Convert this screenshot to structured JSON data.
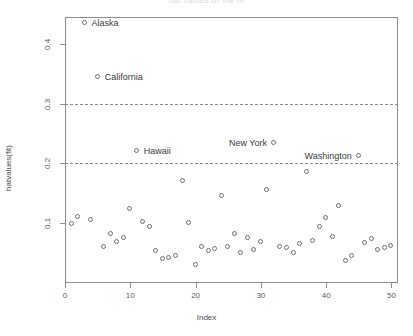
{
  "chart_data": {
    "type": "scatter",
    "title": "hat values of the fit",
    "xlabel": "Index",
    "ylabel": "hatvalues(fit)",
    "xlim": [
      0,
      51
    ],
    "ylim": [
      0.0,
      0.445
    ],
    "xticks": [
      0,
      10,
      20,
      30,
      40,
      50
    ],
    "yticks": [
      0.1,
      0.2,
      0.3,
      0.4
    ],
    "ytick_labels": [
      "0.1",
      "0.2",
      "0.3",
      "0.4"
    ],
    "xtick_labels": [
      "0",
      "10",
      "20",
      "30",
      "40",
      "50"
    ],
    "grid": false,
    "legend": "none",
    "marker": "open-circle",
    "reference_lines": [
      {
        "y": 0.3,
        "style": "dashed",
        "label": "3x mean leverage"
      },
      {
        "y": 0.2,
        "style": "dashed",
        "label": "2x mean leverage"
      }
    ],
    "x": [
      1,
      2,
      3,
      4,
      5,
      6,
      7,
      8,
      9,
      10,
      11,
      12,
      13,
      14,
      15,
      16,
      17,
      18,
      19,
      20,
      21,
      22,
      23,
      24,
      25,
      26,
      27,
      28,
      29,
      30,
      31,
      32,
      33,
      34,
      35,
      36,
      37,
      38,
      39,
      40,
      41,
      42,
      43,
      44,
      45,
      46,
      47,
      48,
      49,
      50
    ],
    "values": [
      0.098,
      0.11,
      0.435,
      0.106,
      0.345,
      0.06,
      0.082,
      0.068,
      0.075,
      0.123,
      0.22,
      0.102,
      0.093,
      0.053,
      0.04,
      0.042,
      0.045,
      0.17,
      0.1,
      0.03,
      0.06,
      0.053,
      0.057,
      0.145,
      0.061,
      0.082,
      0.05,
      0.075,
      0.056,
      0.069,
      0.155,
      0.235,
      0.06,
      0.059,
      0.05,
      0.065,
      0.185,
      0.071,
      0.094,
      0.108,
      0.077,
      0.129,
      0.036,
      0.046,
      0.212,
      0.067,
      0.074,
      0.055,
      0.058,
      0.062
    ],
    "labeled_points": [
      {
        "label": "Alaska",
        "x": 3,
        "y": 0.435,
        "label_side": "right"
      },
      {
        "label": "California",
        "x": 5,
        "y": 0.345,
        "label_side": "right"
      },
      {
        "label": "Hawaii",
        "x": 11,
        "y": 0.22,
        "label_side": "right"
      },
      {
        "label": "New York",
        "x": 32,
        "y": 0.235,
        "label_side": "left"
      },
      {
        "label": "Washington",
        "x": 45,
        "y": 0.212,
        "label_side": "left"
      }
    ],
    "colors": {
      "point_stroke": "#6f6f6f",
      "axis": "#8d8d8d",
      "text": "#4a4a4a",
      "reference_line": "#8a8a8a",
      "background": "#ffffff"
    }
  }
}
